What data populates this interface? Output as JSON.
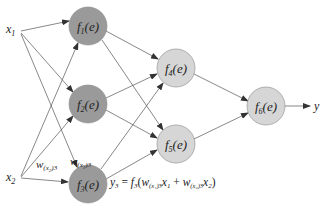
{
  "diagram": {
    "type": "neural-network",
    "colors": {
      "hidden_layer_1_fill": "#9a9a9a",
      "hidden_layer_2_fill": "#d6d6d6",
      "output_fill": "#d6d6d6",
      "edge": "#555555",
      "node_stroke": "#888888"
    },
    "inputs": [
      {
        "id": "x1",
        "label": "x",
        "sub": "1"
      },
      {
        "id": "x2",
        "label": "x",
        "sub": "2"
      }
    ],
    "nodes": [
      {
        "id": "f1",
        "f": "f",
        "sub": "1",
        "arg": "(e)"
      },
      {
        "id": "f2",
        "f": "f",
        "sub": "2",
        "arg": "(e)"
      },
      {
        "id": "f3",
        "f": "f",
        "sub": "3",
        "arg": "(e)"
      },
      {
        "id": "f4",
        "f": "f",
        "sub": "4",
        "arg": "(e)"
      },
      {
        "id": "f5",
        "f": "f",
        "sub": "5",
        "arg": "(e)"
      },
      {
        "id": "f6",
        "f": "f",
        "sub": "6",
        "arg": "(e)"
      }
    ],
    "output": {
      "label": "y"
    },
    "weights": {
      "w_x1_3": {
        "w": "w",
        "sub_open": "(x",
        "sub_idx": "1",
        "sub_close": ")3"
      },
      "w_x2_3": {
        "w": "w",
        "sub_open": "(x",
        "sub_idx": "2",
        "sub_close": ")3"
      }
    },
    "equation": {
      "lhs": "y",
      "lhs_sub": "3",
      "eq": " = ",
      "f": "f",
      "f_sub": "3",
      "open": "(",
      "w1": "w",
      "w1_sub": "(x₁)3",
      "x1": "x",
      "x1_sub": "1",
      "plus": " + ",
      "w2": "w",
      "w2_sub": "(x₂)3",
      "x2": "x",
      "x2_sub": "2",
      "close": ")"
    },
    "edges": [
      [
        "x1",
        "f1"
      ],
      [
        "x1",
        "f2"
      ],
      [
        "x1",
        "f3"
      ],
      [
        "x2",
        "f1"
      ],
      [
        "x2",
        "f2"
      ],
      [
        "x2",
        "f3"
      ],
      [
        "f1",
        "f4"
      ],
      [
        "f1",
        "f5"
      ],
      [
        "f2",
        "f4"
      ],
      [
        "f2",
        "f5"
      ],
      [
        "f3",
        "f4"
      ],
      [
        "f3",
        "f5"
      ],
      [
        "f4",
        "f6"
      ],
      [
        "f5",
        "f6"
      ],
      [
        "f6",
        "y"
      ]
    ]
  }
}
